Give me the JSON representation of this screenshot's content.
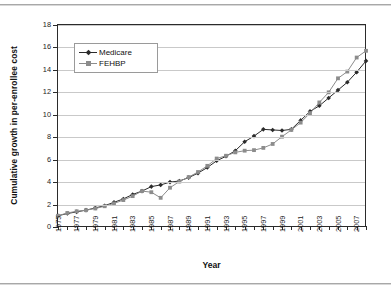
{
  "chart_data": {
    "type": "line",
    "title": "",
    "xlabel": "Year",
    "ylabel": "Cumulative growth in per-enrollee cost",
    "xlim": [
      1975,
      2008
    ],
    "ylim": [
      0,
      18
    ],
    "ytick_step": 2,
    "yticks": [
      "0",
      "2",
      "4",
      "6",
      "8",
      "10",
      "12",
      "14",
      "16",
      "18"
    ],
    "xticks": [
      "1975",
      "1977",
      "1979",
      "1981",
      "1983",
      "1985",
      "1987",
      "1989",
      "1991",
      "1993",
      "1995",
      "1997",
      "1999",
      "2001",
      "2003",
      "2005",
      "2007"
    ],
    "xtick_all_years": [
      1975,
      1976,
      1977,
      1978,
      1979,
      1980,
      1981,
      1982,
      1983,
      1984,
      1985,
      1986,
      1987,
      1988,
      1989,
      1990,
      1991,
      1992,
      1993,
      1994,
      1995,
      1996,
      1997,
      1998,
      1999,
      2000,
      2001,
      2002,
      2003,
      2004,
      2005,
      2006,
      2007,
      2008
    ],
    "grid": "horizontal",
    "legend_position": "upper-left-inside",
    "x": [
      1975,
      1976,
      1977,
      1978,
      1979,
      1980,
      1981,
      1982,
      1983,
      1984,
      1985,
      1986,
      1987,
      1988,
      1989,
      1990,
      1991,
      1992,
      1993,
      1994,
      1995,
      1996,
      1997,
      1998,
      1999,
      2000,
      2001,
      2002,
      2003,
      2004,
      2005,
      2006,
      2007,
      2008
    ],
    "series": [
      {
        "name": "Medicare",
        "color": "#2b2b2b",
        "marker": "diamond",
        "values": [
          1.0,
          1.2,
          1.35,
          1.5,
          1.7,
          1.9,
          2.2,
          2.5,
          2.9,
          3.2,
          3.6,
          3.75,
          4.0,
          4.1,
          4.4,
          4.8,
          5.3,
          5.9,
          6.3,
          6.8,
          7.6,
          8.1,
          8.7,
          8.65,
          8.6,
          8.7,
          9.5,
          10.3,
          10.8,
          11.5,
          12.2,
          12.9,
          13.8,
          14.8
        ]
      },
      {
        "name": "FEHBP",
        "color": "#8c8c8c",
        "marker": "square",
        "values": [
          1.0,
          1.25,
          1.4,
          1.5,
          1.65,
          1.85,
          2.1,
          2.4,
          2.75,
          3.2,
          3.1,
          2.6,
          3.5,
          4.05,
          4.45,
          4.9,
          5.45,
          6.1,
          6.35,
          6.65,
          6.8,
          6.85,
          7.05,
          7.4,
          8.05,
          8.65,
          9.3,
          10.15,
          11.1,
          12.0,
          13.25,
          13.85,
          15.1,
          15.7
        ]
      }
    ]
  }
}
